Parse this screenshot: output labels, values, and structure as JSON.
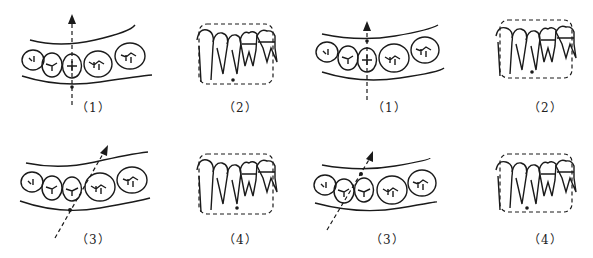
{
  "figure": {
    "groups": [
      {
        "name": "left-group",
        "panels": [
          {
            "id": "1",
            "caption": "（1）",
            "view": "occlusal",
            "arrow": "vertical"
          },
          {
            "id": "2",
            "caption": "（2）",
            "view": "lateral"
          },
          {
            "id": "3",
            "caption": "（3）",
            "view": "occlusal",
            "arrow": "oblique"
          },
          {
            "id": "4",
            "caption": "（4）",
            "view": "lateral"
          }
        ]
      },
      {
        "name": "right-group",
        "panels": [
          {
            "id": "1",
            "caption": "（1）",
            "view": "occlusal",
            "arrow": "vertical"
          },
          {
            "id": "2",
            "caption": "（2）",
            "view": "lateral"
          },
          {
            "id": "3",
            "caption": "（3）",
            "view": "occlusal",
            "arrow": "oblique"
          },
          {
            "id": "4",
            "caption": "（4）",
            "view": "lateral"
          }
        ]
      }
    ],
    "colors": {
      "ink": "#1a1a1a",
      "background": "#ffffff"
    }
  }
}
